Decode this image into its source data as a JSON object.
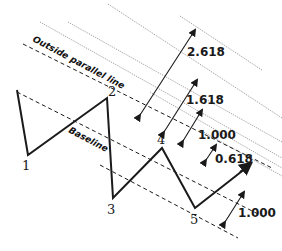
{
  "diagram": {
    "labels": {
      "outside_line": "Outside parallel line",
      "baseline": "Baseline"
    },
    "points": [
      {
        "id": "1",
        "label": "1"
      },
      {
        "id": "2",
        "label": "2"
      },
      {
        "id": "3",
        "label": "3"
      },
      {
        "id": "4",
        "label": "4"
      },
      {
        "id": "5",
        "label": "5"
      }
    ],
    "ratios": {
      "r2618": "2.618",
      "r1618": "1.618",
      "r1000a": "1.000",
      "r0618": "0.618",
      "r1000b": "1.000"
    },
    "colors": {
      "line": "#1a1a1a",
      "dotted": "#8a8a8a"
    }
  }
}
